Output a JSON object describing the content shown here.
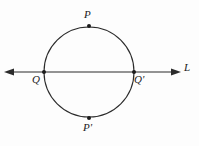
{
  "figure": {
    "background_color": "#fdfdfd",
    "stroke_color": "#2b2b2b",
    "label_color": "#1b1b1b",
    "width": 199,
    "height": 146,
    "circle": {
      "center_x": 89,
      "center_y": 72,
      "radius": 45,
      "stroke_width": 1.1
    },
    "line": {
      "name": "L",
      "y": 72,
      "x_start": 5,
      "x_end": 180,
      "stroke_width": 1.1,
      "arrow_left": true,
      "arrow_right": true
    },
    "points": [
      {
        "id": "P",
        "label": "P",
        "x": 89,
        "y": 26,
        "dot_radius": 2.0
      },
      {
        "id": "Q",
        "label": "Q",
        "x": 44,
        "y": 72,
        "dot_radius": 2.0
      },
      {
        "id": "Qp",
        "label": "Q'",
        "x": 134,
        "y": 72,
        "dot_radius": 2.0
      },
      {
        "id": "Pp",
        "label": "P'",
        "x": 89,
        "y": 118,
        "dot_radius": 2.0
      }
    ],
    "labels": {
      "P": "P",
      "P_prime": "P'",
      "Q": "Q",
      "Q_prime": "Q'",
      "L": "L"
    }
  },
  "chart_data": {
    "type": "scatter",
    "xlabel": "",
    "ylabel": "",
    "xlim": [
      0,
      199
    ],
    "ylim": [
      0,
      146
    ],
    "grid": false,
    "legend": null,
    "annotations": [
      "P",
      "Q",
      "Q'",
      "P'",
      "L"
    ],
    "shapes": [
      {
        "kind": "circle",
        "center": [
          89,
          72
        ],
        "radius": 45
      },
      {
        "kind": "line",
        "label": "L",
        "from": [
          5,
          72
        ],
        "to": [
          180,
          72
        ],
        "arrows": "both"
      }
    ],
    "x": [
      89,
      44,
      134,
      89
    ],
    "y": [
      26,
      72,
      72,
      118
    ],
    "point_labels": [
      "P",
      "Q",
      "Q'",
      "P'"
    ]
  }
}
